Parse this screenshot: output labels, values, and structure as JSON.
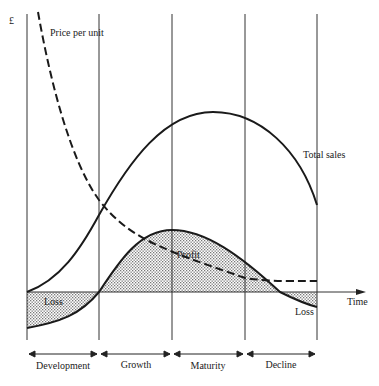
{
  "diagram": {
    "y_axis_symbol": "£",
    "x_axis_label": "Time",
    "curves": {
      "price": "Price per unit",
      "sales": "Total sales",
      "profit": "Profit",
      "loss_left": "Loss",
      "loss_right": "Loss"
    },
    "phases": [
      "Development",
      "Growth",
      "Maturity",
      "Decline"
    ],
    "colors": {
      "line": "#1a1a1a",
      "fill": "#cfcfcf"
    }
  }
}
